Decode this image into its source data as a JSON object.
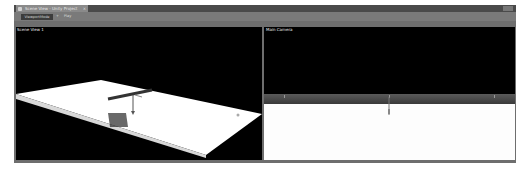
{
  "window": {
    "tab": {
      "label": "Scene View - Unity Project",
      "icon": "scene-icon",
      "close_glyph": "×"
    },
    "toolbar": {
      "mode_button": "ViewportMode",
      "items": [
        "+",
        "Play"
      ]
    }
  },
  "viewports": [
    {
      "label": "Scene View 1",
      "camera": "perspective"
    },
    {
      "label": "Main Camera",
      "camera": "front"
    }
  ],
  "colors": {
    "frame": "#6e6e6e",
    "tabbar": "#4a4a4a",
    "viewport_bg": "#000000",
    "plane": "#ffffff",
    "object": "#3a3a3a"
  }
}
